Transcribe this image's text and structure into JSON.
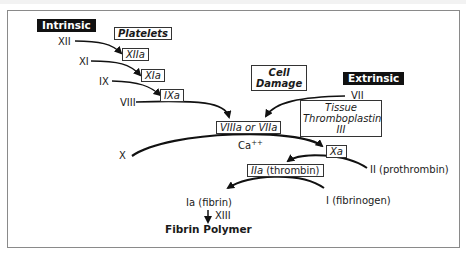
{
  "diagram": {
    "pathways": {
      "intrinsic": "Intrinsic",
      "extrinsic": "Extrinsic"
    },
    "intrinsic_factors": [
      "XII",
      "XI",
      "IX",
      "VIII"
    ],
    "activated_boxes": {
      "platelets": "Platelets",
      "xiia": "XIIa",
      "xia": "XIa",
      "ixa": "IXa",
      "viiia_or_viia": "VIIIa or VIIa",
      "xa": "Xa",
      "iia": "IIa",
      "iia_suffix": " (thrombin)"
    },
    "cell_damage": [
      "Cell",
      "Damage"
    ],
    "tissue_thromboplastin": [
      "Tissue",
      "Thromboplastin",
      "III"
    ],
    "extrinsic_factor": "VII",
    "factor_x": "X",
    "calcium": "Ca",
    "calcium_sup": "++",
    "prothrombin": "II (prothrombin)",
    "fibrinogen": "I (fibrinogen)",
    "fibrin": "Ia (fibrin)",
    "xiii": "XIII",
    "result": "Fibrin Polymer"
  }
}
